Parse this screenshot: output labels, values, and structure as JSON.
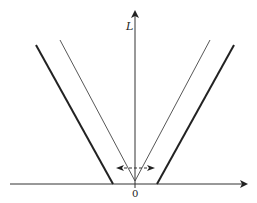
{
  "diagram": {
    "axis_y_label": "L",
    "origin_label": "0",
    "colors": {
      "axis": "#333333",
      "thick_line": "#222222",
      "thin_line": "#444444",
      "dashed": "#333333"
    }
  }
}
